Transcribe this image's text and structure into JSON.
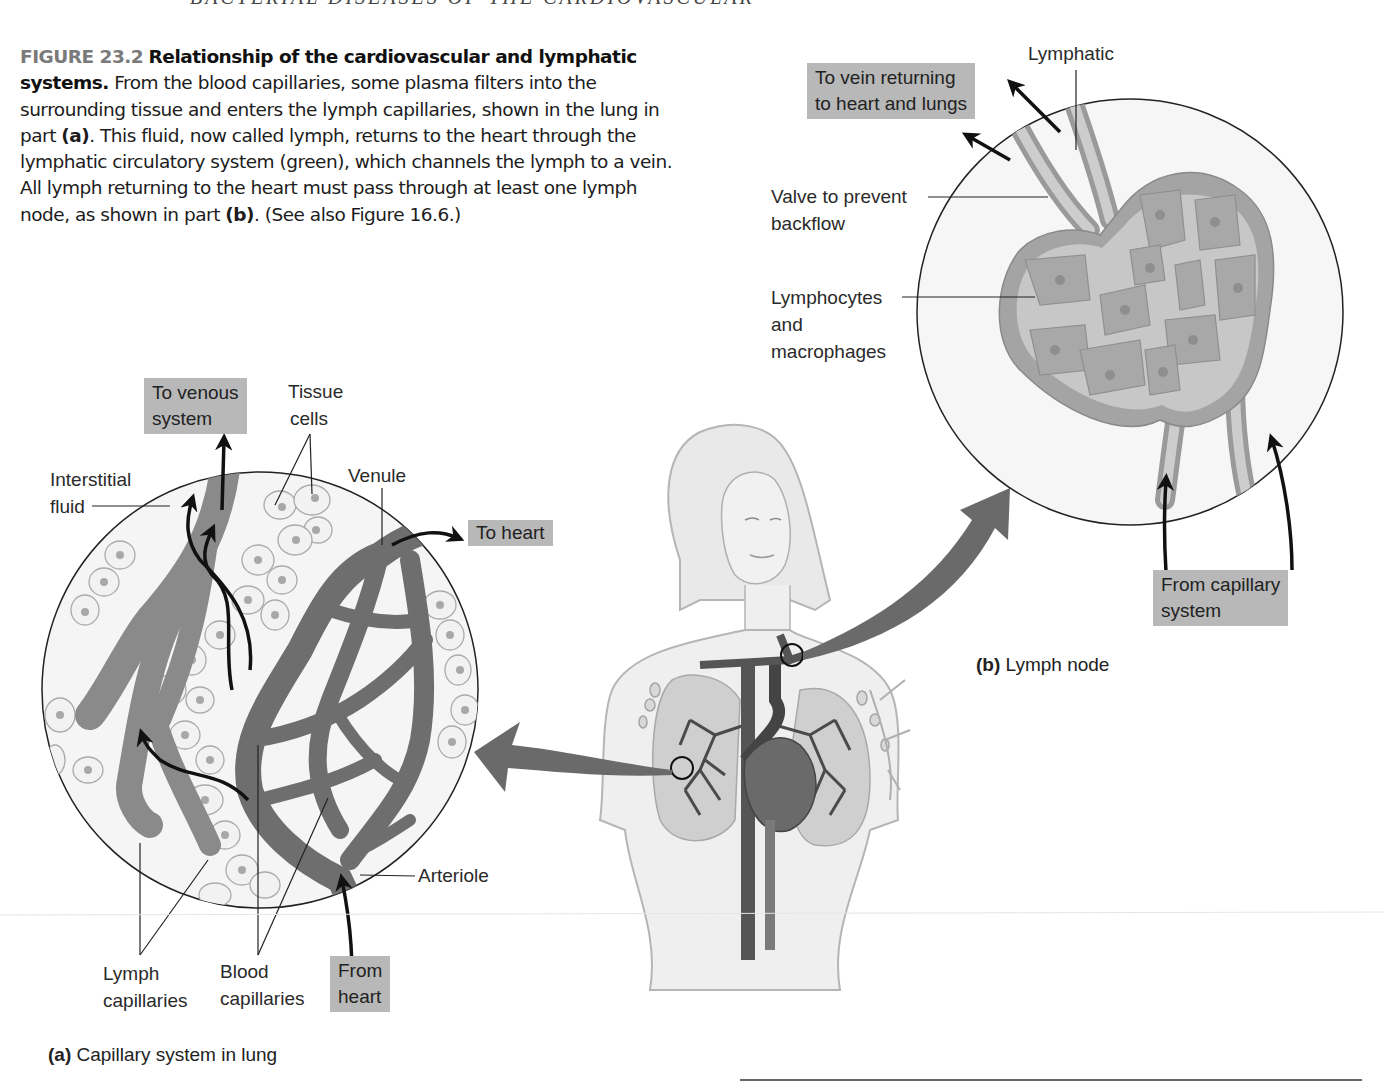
{
  "running_head": "BACTERIAL DISEASES OF THE CARDIOVASCULAR",
  "caption": {
    "figure_number": "FIGURE 23.2",
    "title": "Relationship of the cardiovascular and lymphatic systems.",
    "body_1": " From the blood capillaries, some plasma filters into the surrounding tissue and enters the lymph capillaries, shown in the lung in part ",
    "ref_a": "(a)",
    "body_2": ". This fluid, now called lymph, returns to the heart through the lymphatic circulatory system (green), which channels the lymph to a vein. All lymph returning to the heart must pass through at least one lymph node, as shown in part ",
    "ref_b": "(b)",
    "body_3": ". (See also Figure 16.6.)"
  },
  "part_a": {
    "letter": "(a)",
    "title": "Capillary system in lung",
    "labels": {
      "interstitial_fluid_1": "Interstitial",
      "interstitial_fluid_2": "fluid",
      "tissue_cells_1": "Tissue",
      "tissue_cells_2": "cells",
      "venule": "Venule",
      "arteriole": "Arteriole",
      "lymph_capillaries_1": "Lymph",
      "lymph_capillaries_2": "capillaries",
      "blood_capillaries_1": "Blood",
      "blood_capillaries_2": "capillaries"
    },
    "boxes": {
      "to_venous_1": "To venous",
      "to_venous_2": "system",
      "to_heart": "To heart",
      "from_heart_1": "From",
      "from_heart_2": "heart"
    }
  },
  "part_b": {
    "letter": "(b)",
    "title": "Lymph node",
    "labels": {
      "lymphatic": "Lymphatic",
      "valve_1": "Valve to prevent",
      "valve_2": "backflow",
      "lymphocytes_1": "Lymphocytes",
      "lymphocytes_2": "and",
      "lymphocytes_3": "macrophages"
    },
    "boxes": {
      "to_vein_1": "To vein returning",
      "to_vein_2": "to heart and lungs",
      "from_capillary_1": "From capillary",
      "from_capillary_2": "system"
    }
  },
  "colors": {
    "label_box": "#b8b8b8",
    "vessel_dark": "#6e6e6e",
    "lymph_vessel": "#8a8a8a",
    "circle_fill": "#f4f4f4",
    "node_fill": "#a9a9a9",
    "node_light": "#c8c8c8",
    "pointer_arrow": "#6a6a6a"
  }
}
